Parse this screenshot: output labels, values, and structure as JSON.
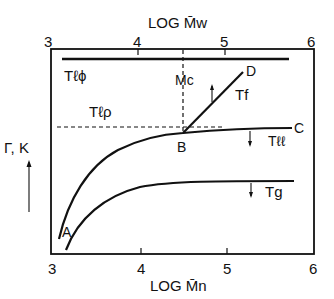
{
  "top_axis": {
    "title": "LOG M̄w",
    "ticks": [
      "3",
      "4",
      "5",
      "6"
    ]
  },
  "bottom_axis": {
    "title": "LOG M̄n",
    "ticks": [
      "3",
      "4",
      "5",
      "6"
    ]
  },
  "y_axis": {
    "title": "Γ, K"
  },
  "labels": {
    "t_lphi": "Tℓϕ",
    "t_lrho": "Tℓρ",
    "mc": "Mc",
    "t_f": "Tf",
    "t_ll": "Tℓℓ",
    "t_g": "Tg",
    "point_a": "A",
    "point_b": "B",
    "point_c": "C",
    "point_d": "D"
  },
  "curves": [
    {
      "name": "T_lphi",
      "description": "horizontal line near top"
    },
    {
      "name": "T_lrho",
      "description": "dashed horizontal line through B"
    },
    {
      "name": "Mc",
      "description": "dashed vertical line at critical molecular weight"
    },
    {
      "name": "T_ll",
      "description": "curve A to B to C"
    },
    {
      "name": "T_f",
      "description": "straight line B to D"
    },
    {
      "name": "T_g",
      "description": "lower curve leveling off"
    }
  ]
}
